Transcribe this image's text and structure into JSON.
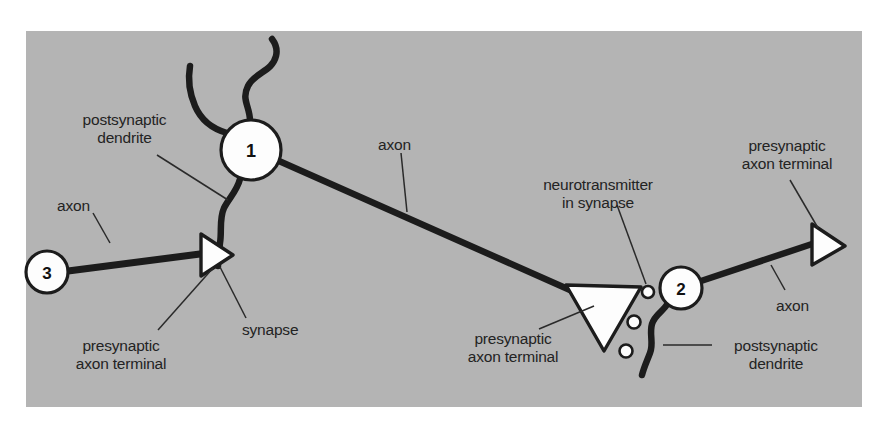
{
  "figure": {
    "background_color": "#ffffff",
    "panel_color": "#b4b4b4",
    "ink_color": "#1c1c1c",
    "cell_fill_color": "#fdfdfd"
  },
  "neurons": [
    {
      "id": "neuron-1",
      "number": "1",
      "cx": 251,
      "cy": 150,
      "r": 30
    },
    {
      "id": "neuron-2",
      "number": "2",
      "cx": 681,
      "cy": 288,
      "r": 21
    },
    {
      "id": "neuron-3",
      "number": "3",
      "cx": 47,
      "cy": 272,
      "r": 21
    }
  ],
  "labels": {
    "postsynaptic_dendrite_left": "postsynaptic\ndendrite",
    "postsynaptic_dendrite_left_line1": "postsynaptic",
    "postsynaptic_dendrite_left_line2": "dendrite",
    "axon_left": "axon",
    "axon_center": "axon",
    "axon_right": "axon",
    "synapse": "synapse",
    "presynaptic_axon_terminal_left_line1": "presynaptic",
    "presynaptic_axon_terminal_left_line2": "axon terminal",
    "presynaptic_axon_terminal_center_line1": "presynaptic",
    "presynaptic_axon_terminal_center_line2": "axon terminal",
    "presynaptic_axon_terminal_right_line1": "presynaptic",
    "presynaptic_axon_terminal_right_line2": "axon terminal",
    "neurotransmitter_line1": "neurotransmitter",
    "neurotransmitter_line2": "in synapse",
    "postsynaptic_dendrite_right_line1": "postsynaptic",
    "postsynaptic_dendrite_right_line2": "dendrite"
  },
  "vesicles": [
    {
      "cx": 648,
      "cy": 292,
      "r": 6
    },
    {
      "cx": 634,
      "cy": 322,
      "r": 6.5
    },
    {
      "cx": 626,
      "cy": 351,
      "r": 6.5
    }
  ]
}
